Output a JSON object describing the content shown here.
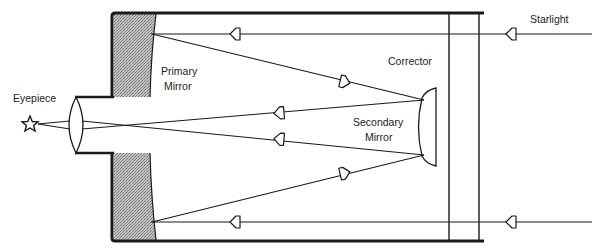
{
  "diagram": {
    "type": "optical-schematic",
    "colors": {
      "line": "#1a1a1a",
      "mirror_fill": "#b8b8b8",
      "background": "#ffffff"
    },
    "labels": {
      "eyepiece": "Eyepiece",
      "primary_line1": "Primary",
      "primary_line2": "Mirror",
      "corrector": "Corrector",
      "secondary_line1": "Secondary",
      "secondary_line2": "Mirror",
      "starlight": "Starlight"
    },
    "components": [
      {
        "name": "Eyepiece",
        "icon": "star-icon"
      },
      {
        "name": "Primary Mirror"
      },
      {
        "name": "Secondary Mirror"
      },
      {
        "name": "Corrector"
      },
      {
        "name": "Starlight"
      }
    ],
    "arrows": {
      "direction_incoming": "left",
      "count": 8
    }
  }
}
